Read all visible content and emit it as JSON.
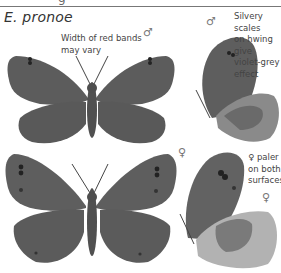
{
  "header": {
    "cut_glyph": "g",
    "species_title": "E. pronoe"
  },
  "annotations": {
    "red_bands": [
      "Width of red bands",
      "may vary"
    ],
    "silvery": [
      "Silvery scales",
      "on hwing give",
      "violet-grey",
      "effect"
    ],
    "female_paler": [
      "♀ paler",
      "on both",
      "surfaces"
    ]
  },
  "symbols": {
    "male_upperside": "♂",
    "male_underside": "♂",
    "female_upperside": "♀",
    "female_underside": "♀"
  },
  "colors": {
    "wing": "#5e5e5e",
    "wing_dark": "#4a4a4a",
    "body": "#555555",
    "hindwing_under_light": "#b4b4b4",
    "hindwing_under_band": "#7a7a7a",
    "rule": "#777777"
  }
}
